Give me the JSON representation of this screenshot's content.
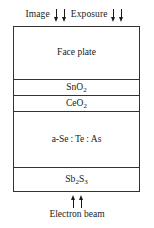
{
  "diagram": {
    "colors": {
      "background": "#ffffff",
      "border": "#333333",
      "text": "#1a1a1a"
    },
    "top_annotations": [
      {
        "label": "Image",
        "arrows": 2,
        "direction": "down"
      },
      {
        "label": "Exposure",
        "arrows": 2,
        "direction": "down"
      }
    ],
    "layers": [
      {
        "name": "face-plate",
        "label": "Face plate",
        "formula_html": "Face plate"
      },
      {
        "name": "sno2",
        "label": "SnO2",
        "formula_html": "SnO<sub>2</sub>"
      },
      {
        "name": "ceo2",
        "label": "CeO2",
        "formula_html": "CeO<sub>2</sub>"
      },
      {
        "name": "a-se-te-as",
        "label": "a-Se : Te : As",
        "formula_html": "a-Se : Te : As"
      },
      {
        "name": "sb2s3",
        "label": "Sb2S3",
        "formula_html": "Sb<sub>2</sub>S<sub>3</sub>"
      }
    ],
    "bottom_annotation": {
      "label": "Electron beam",
      "arrows": 2,
      "direction": "up"
    }
  }
}
